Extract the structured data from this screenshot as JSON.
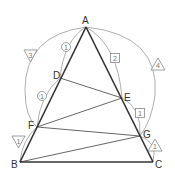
{
  "diagram": {
    "type": "geometry-triangle",
    "points": {
      "A": {
        "label": "A",
        "x": 86,
        "y": 27
      },
      "B": {
        "label": "B",
        "x": 20,
        "y": 162
      },
      "C": {
        "label": "C",
        "x": 153,
        "y": 162
      },
      "D": {
        "label": "D",
        "x": 60,
        "y": 78
      },
      "E": {
        "label": "E",
        "x": 122,
        "y": 98
      },
      "F": {
        "label": "F",
        "x": 37,
        "y": 127
      },
      "G": {
        "label": "G",
        "x": 140,
        "y": 136
      }
    },
    "segments": [
      "AB",
      "AC",
      "BC",
      "DE",
      "EF",
      "FG",
      "GB"
    ],
    "ratio_markers": [
      {
        "shape": "inverted-triangle",
        "value": "3",
        "between": "A-F (outer arc, left)"
      },
      {
        "shape": "inverted-triangle",
        "value": "1",
        "between": "F-B"
      },
      {
        "shape": "circle",
        "value": "1",
        "between": "A-D"
      },
      {
        "shape": "circle",
        "value": "1",
        "between": "D-F"
      },
      {
        "shape": "triangle",
        "value": "4",
        "between": "A-G (outer arc, right)"
      },
      {
        "shape": "triangle",
        "value": "1",
        "between": "G-C"
      },
      {
        "shape": "square",
        "value": "2",
        "between": "A-E"
      },
      {
        "shape": "square",
        "value": "1",
        "between": "E-G"
      }
    ],
    "colors": {
      "main_line": "#333333",
      "inner_line": "#555555",
      "arc": "#999999",
      "marker": "#777777"
    }
  }
}
